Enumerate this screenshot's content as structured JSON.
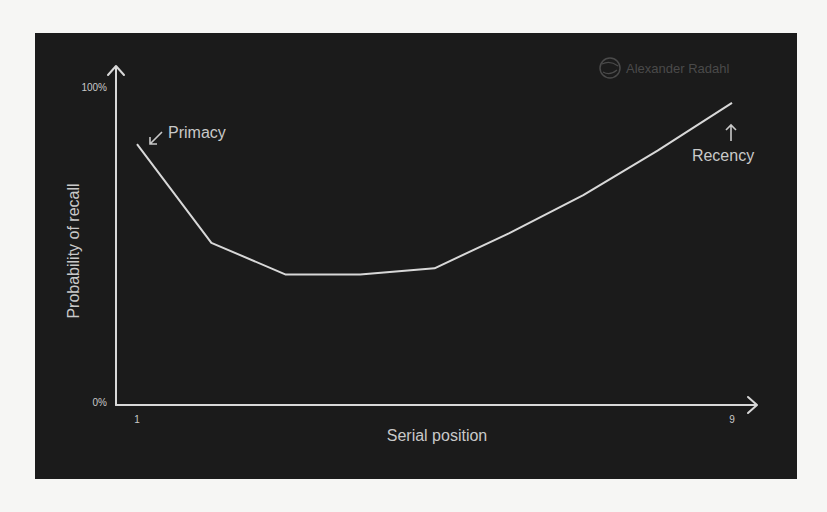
{
  "chart_data": {
    "type": "line",
    "title": "",
    "xlabel": "Serial position",
    "ylabel": "Probability of recall",
    "x": [
      1,
      2,
      3,
      4,
      5,
      6,
      7,
      8,
      9
    ],
    "series": [
      {
        "name": "Probability of recall",
        "values": [
          82,
          51,
          41,
          41,
          43,
          54,
          66,
          80,
          95
        ]
      }
    ],
    "x_tick_labels": [
      "1",
      "9"
    ],
    "y_tick_labels": [
      "0%",
      "100%"
    ],
    "xlim": [
      1,
      9
    ],
    "ylim": [
      0,
      100
    ],
    "grid": false,
    "legend": null,
    "annotations": [
      {
        "text": "Primacy",
        "arrow": "↙",
        "points_to": 1
      },
      {
        "text": "Recency",
        "arrow": "↑",
        "points_to": 9
      }
    ],
    "watermark": "Alexander Radahl"
  },
  "colors": {
    "background": "#1b1b1b",
    "page": "#f6f6f4",
    "line": "#d8d8d8",
    "text": "#c9c9c9",
    "watermark": "#4a4a4a"
  }
}
